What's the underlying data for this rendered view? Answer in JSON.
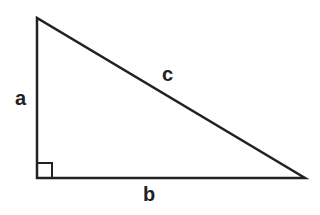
{
  "diagram": {
    "type": "right-triangle",
    "labels": {
      "vertical_side": "a",
      "horizontal_side": "b",
      "hypotenuse": "c"
    },
    "vertices": {
      "top": [
        37,
        18
      ],
      "right_angle": [
        37,
        178
      ],
      "right": [
        305,
        178
      ]
    },
    "right_angle_marker": true,
    "stroke_color": "#222222",
    "background": "#ffffff"
  }
}
